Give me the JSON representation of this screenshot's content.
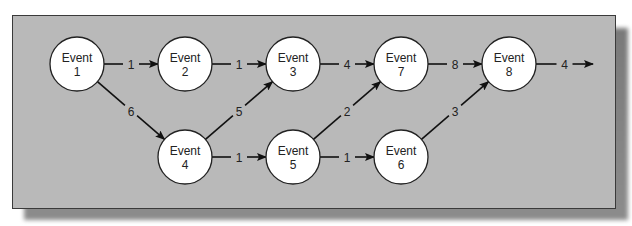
{
  "diagram": {
    "type": "network-activity-diagram",
    "node_word": "Event",
    "nodes": [
      {
        "id": "1",
        "label_top": "Event",
        "label_bottom": "1"
      },
      {
        "id": "2",
        "label_top": "Event",
        "label_bottom": "2"
      },
      {
        "id": "3",
        "label_top": "Event",
        "label_bottom": "3"
      },
      {
        "id": "4",
        "label_top": "Event",
        "label_bottom": "4"
      },
      {
        "id": "5",
        "label_top": "Event",
        "label_bottom": "5"
      },
      {
        "id": "6",
        "label_top": "Event",
        "label_bottom": "6"
      },
      {
        "id": "7",
        "label_top": "Event",
        "label_bottom": "7"
      },
      {
        "id": "8",
        "label_top": "Event",
        "label_bottom": "8"
      }
    ],
    "edges": [
      {
        "from": "1",
        "to": "2",
        "weight": "1"
      },
      {
        "from": "1",
        "to": "4",
        "weight": "6"
      },
      {
        "from": "2",
        "to": "3",
        "weight": "1"
      },
      {
        "from": "4",
        "to": "3",
        "weight": "5"
      },
      {
        "from": "4",
        "to": "5",
        "weight": "1"
      },
      {
        "from": "3",
        "to": "7",
        "weight": "4"
      },
      {
        "from": "5",
        "to": "7",
        "weight": "2"
      },
      {
        "from": "5",
        "to": "6",
        "weight": "1"
      },
      {
        "from": "7",
        "to": "8",
        "weight": "8"
      },
      {
        "from": "6",
        "to": "8",
        "weight": "3"
      },
      {
        "from": "8",
        "to": "out",
        "weight": "4"
      }
    ]
  }
}
